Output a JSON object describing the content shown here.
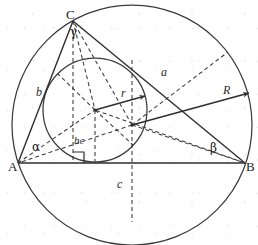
{
  "figure": {
    "title_cut_fragment": "g",
    "width": 258,
    "height": 245,
    "stroke_color": "#303030",
    "background_color": "#ffffff"
  },
  "vertices": [
    {
      "name": "A",
      "label": "A",
      "x": 18,
      "y": 163
    },
    {
      "name": "B",
      "label": "B",
      "x": 245,
      "y": 163
    },
    {
      "name": "C",
      "label": "C",
      "x": 73,
      "y": 21
    }
  ],
  "sides": [
    {
      "name": "side-a",
      "label": "a",
      "between": "C-B",
      "label_x": 163,
      "label_y": 72
    },
    {
      "name": "side-b",
      "label": "b",
      "between": "A-C",
      "label_x": 38,
      "label_y": 92
    },
    {
      "name": "side-c",
      "label": "c",
      "between": "A-B",
      "label_x": 118,
      "label_y": 184
    }
  ],
  "angles": [
    {
      "name": "angle-alpha",
      "label": "α",
      "at_vertex": "A",
      "label_x": 34,
      "label_y": 147
    },
    {
      "name": "angle-beta",
      "label": "β",
      "at_vertex": "B",
      "label_x": 212,
      "label_y": 148
    },
    {
      "name": "angle-gamma",
      "label": "γ",
      "at_vertex": "C",
      "label_x": 72,
      "label_y": 32
    }
  ],
  "radii": [
    {
      "name": "inradius",
      "label": "r",
      "from": "incenter",
      "to": "incircle-tangent",
      "label_x": 123,
      "label_y": 93
    },
    {
      "name": "circumradius",
      "label": "R",
      "from": "circumcenter",
      "to": "circumcircle-edge",
      "label_x": 225,
      "label_y": 90
    }
  ],
  "altitude": {
    "name": "altitude-hc",
    "label": "hc",
    "from_vertex": "C",
    "to_side": "c",
    "label_x": 78,
    "label_y": 141,
    "right_angle_marked": true
  },
  "circles": [
    {
      "name": "circumcircle",
      "cx": 132,
      "cy": 125,
      "r": 120,
      "style": "solid"
    },
    {
      "name": "incircle",
      "cx": 95,
      "cy": 110,
      "r": 52,
      "style": "solid"
    }
  ],
  "centers": [
    {
      "name": "incenter",
      "x": 95,
      "y": 110
    },
    {
      "name": "circumcenter",
      "x": 132,
      "y": 125
    }
  ]
}
